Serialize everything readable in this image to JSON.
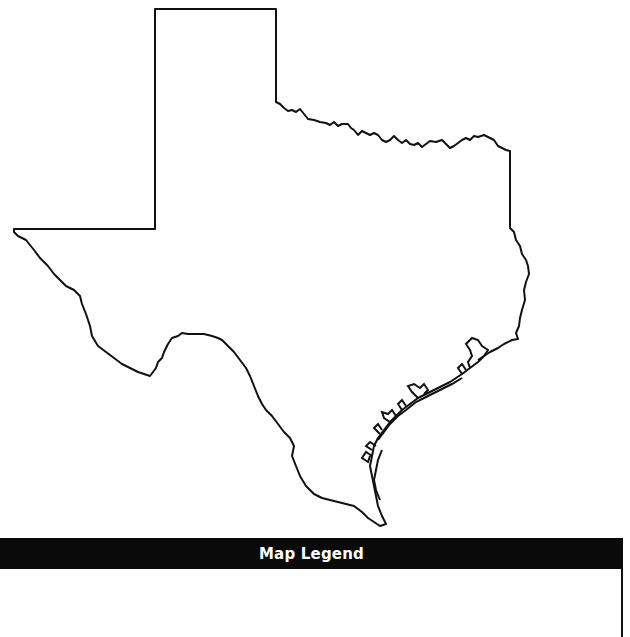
{
  "map": {
    "subject": "Texas state outline",
    "stroke_color": "#111111",
    "fill_color": "#ffffff"
  },
  "legend": {
    "title": "Map Legend",
    "bar_color": "#0a0a0a",
    "title_color": "#ffffff",
    "entries": []
  }
}
